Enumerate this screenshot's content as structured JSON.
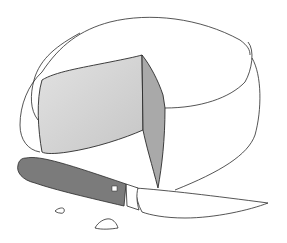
{
  "illustration": {
    "subject": "Cheese wheel with a wedge cut out and a cheese knife",
    "colors": {
      "background": "#ffffff",
      "outline": "#2a2a2a",
      "cut_face_light": "#dcdcdc",
      "cut_face_light_end": "#c8c8c8",
      "cut_face_side": "#a9a9a9",
      "knife_handle": "#7b7b7b",
      "knife_blade": "#ffffff",
      "rivet": "#ffffff"
    }
  }
}
